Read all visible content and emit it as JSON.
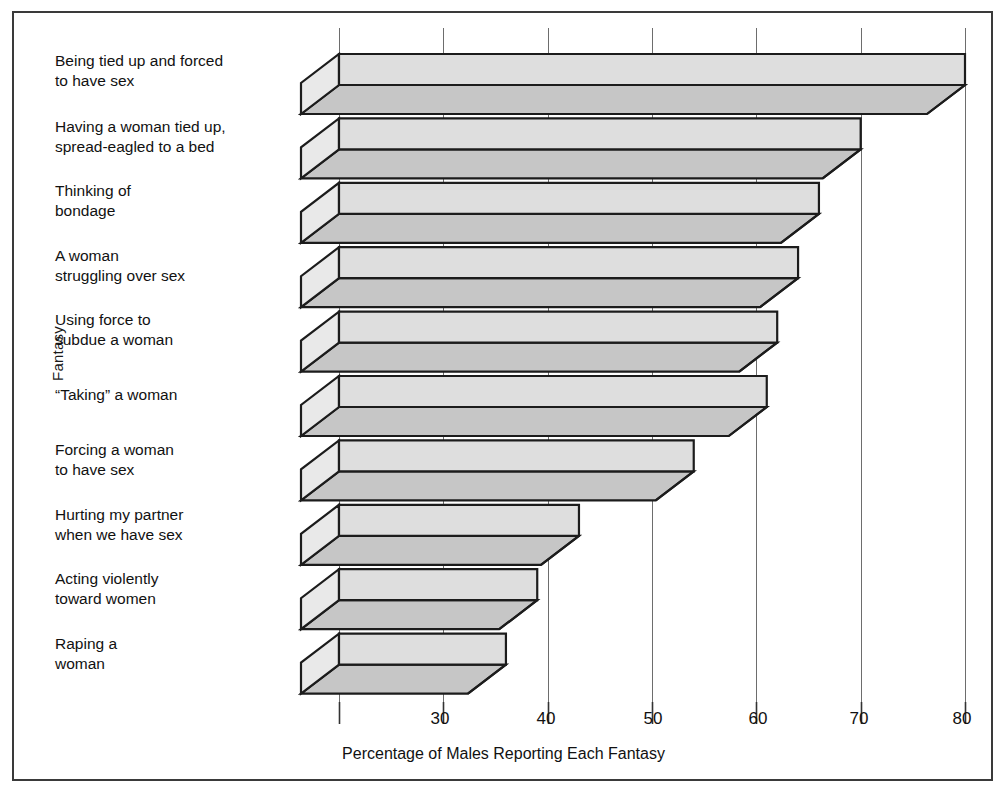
{
  "chart_data": {
    "type": "bar",
    "orientation": "horizontal",
    "style": "3d-ribbon",
    "title": "",
    "xlabel": "Percentage of Males Reporting Each Fantasy",
    "ylabel": "Fantasy",
    "categories": [
      "Being tied up and forced to have sex",
      "Having a woman tied up, spread-eagled to a bed",
      "Thinking of bondage",
      "A woman struggling over sex",
      "Using force to subdue a woman",
      "“Taking” a woman",
      "Forcing a woman to have sex",
      "Hurting my partner when we have sex",
      "Acting violently toward women",
      "Raping a woman"
    ],
    "values": [
      80,
      70,
      66,
      64,
      62,
      61,
      54,
      43,
      39,
      36
    ],
    "xlim": [
      20,
      80
    ],
    "xticks": [
      20,
      30,
      40,
      50,
      60,
      70,
      80
    ],
    "xticklabels": [
      "",
      "30",
      "40",
      "50",
      "60",
      "70",
      "80"
    ],
    "grid": true,
    "legend": false,
    "colors": {
      "bar_top": "#dedede",
      "bar_front": "#c6c6c6",
      "bar_cap": "#e9e9e9",
      "outline": "#1c1c1c",
      "gridline": "#6d6d6d",
      "frame": "#3a3a3a",
      "text": "#111111",
      "background": "#ffffff"
    }
  },
  "axis": {
    "y_title": "Fantasy",
    "x_title": "Percentage of Males Reporting Each Fantasy",
    "tick_30": "30",
    "tick_40": "40",
    "tick_50": "50",
    "tick_60": "60",
    "tick_70": "70",
    "tick_80": "80"
  },
  "labels": {
    "row0_line0": "Being tied up and forced",
    "row0_line1": "to have sex",
    "row1_line0": "Having a woman tied up,",
    "row1_line1": "spread-eagled to a bed",
    "row2_line0": "Thinking of",
    "row2_line1": "bondage",
    "row3_line0": "A woman",
    "row3_line1": "struggling over sex",
    "row4_line0": "Using force to",
    "row4_line1": "subdue a woman",
    "row5_line0": "“Taking” a woman",
    "row5_line1": "",
    "row6_line0": "Forcing a woman",
    "row6_line1": "to have sex",
    "row7_line0": "Hurting my partner",
    "row7_line1": "when we have sex",
    "row8_line0": "Acting violently",
    "row8_line1": "toward women",
    "row9_line0": "Raping a",
    "row9_line1": "woman"
  }
}
